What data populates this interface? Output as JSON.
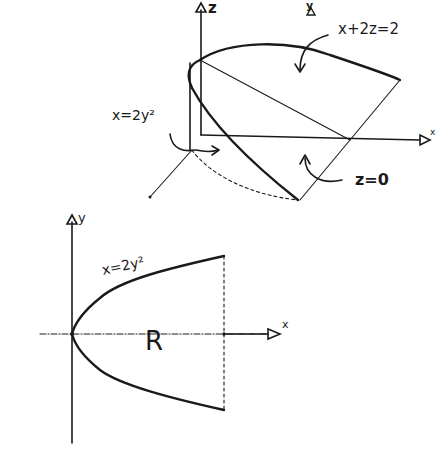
{
  "figure_3d": {
    "axes": {
      "x_label": "x",
      "y_label": "y",
      "z_label": "z"
    },
    "surfaces": [
      {
        "id": "plane",
        "label": "x+2z=2"
      },
      {
        "id": "cylinder",
        "label": "x=2y²"
      },
      {
        "id": "base",
        "label": "z=0"
      }
    ]
  },
  "figure_2d": {
    "axes": {
      "x_label": "x",
      "y_label": "y"
    },
    "curve_label": "x=2y²",
    "region_label": "R"
  },
  "colors": {
    "ink": "#1a1a1a",
    "background": "#ffffff"
  }
}
